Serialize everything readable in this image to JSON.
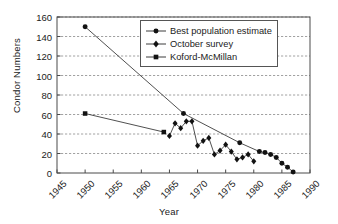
{
  "chart_data": {
    "type": "line",
    "title": "",
    "xlabel": "Year",
    "ylabel": "Condor Numbers",
    "xlim": [
      1945,
      1990
    ],
    "ylim": [
      0,
      160
    ],
    "xticks": [
      1945,
      1950,
      1955,
      1960,
      1965,
      1970,
      1975,
      1980,
      1985,
      1990
    ],
    "yticks": [
      0,
      20,
      40,
      60,
      80,
      100,
      120,
      140,
      160
    ],
    "grid": "horizontal-dashed",
    "legend_position": "top-right-inside",
    "series": [
      {
        "name": "Best population estimate",
        "marker": "circle",
        "points": [
          [
            1950,
            150
          ],
          [
            1967.5,
            61
          ],
          [
            1977.5,
            31
          ],
          [
            1981,
            22
          ],
          [
            1982,
            21
          ],
          [
            1983,
            19
          ],
          [
            1984,
            16
          ],
          [
            1985,
            10
          ],
          [
            1986,
            6
          ],
          [
            1987,
            1
          ]
        ]
      },
      {
        "name": "October survey",
        "marker": "diamond",
        "points": [
          [
            1965,
            38
          ],
          [
            1966,
            51
          ],
          [
            1967,
            46
          ],
          [
            1968,
            53
          ],
          [
            1969,
            53
          ],
          [
            1970,
            28
          ],
          [
            1971,
            33
          ],
          [
            1972,
            36
          ],
          [
            1973,
            19
          ],
          [
            1974,
            23
          ],
          [
            1975,
            29
          ],
          [
            1976,
            22
          ],
          [
            1977,
            14
          ],
          [
            1978,
            16
          ],
          [
            1979,
            19
          ],
          [
            1980,
            12
          ]
        ]
      },
      {
        "name": "Koford-McMillan",
        "marker": "square",
        "points": [
          [
            1950,
            61
          ],
          [
            1964,
            42
          ]
        ]
      }
    ]
  },
  "legend": {
    "items": [
      {
        "label": "Best population estimate",
        "marker": "circle"
      },
      {
        "label": "October survey",
        "marker": "diamond"
      },
      {
        "label": "Koford-McMillan",
        "marker": "square"
      }
    ]
  }
}
